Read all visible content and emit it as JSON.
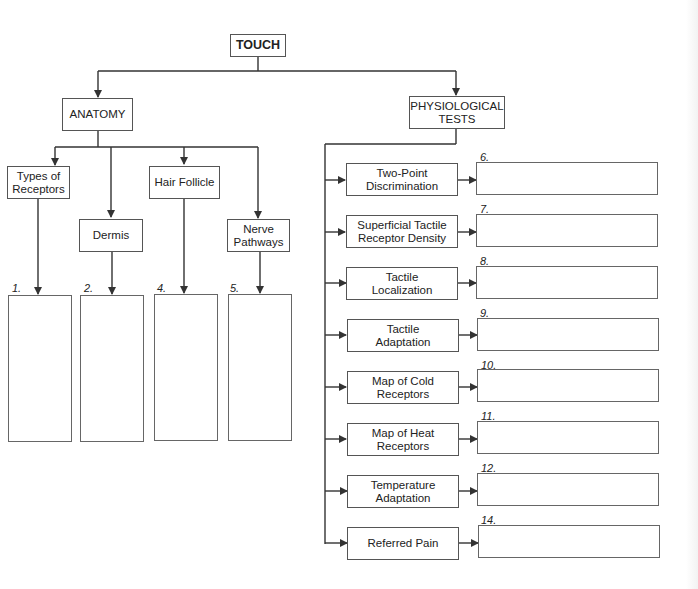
{
  "root": {
    "label": "TOUCH"
  },
  "anatomy": {
    "label": "ANATOMY",
    "children": [
      {
        "label": "Types of\nReceptors",
        "number": "1."
      },
      {
        "label": "Dermis",
        "number": "2."
      },
      {
        "label": "Hair Follicle",
        "number": "4."
      },
      {
        "label": "Nerve\nPathways",
        "number": "5."
      }
    ]
  },
  "physiological": {
    "label": "PHYSIOLOGICAL\nTESTS",
    "tests": [
      {
        "label": "Two-Point\nDiscrimination",
        "number": "6."
      },
      {
        "label": "Superficial Tactile\nReceptor Density",
        "number": "7."
      },
      {
        "label": "Tactile\nLocalization",
        "number": "8."
      },
      {
        "label": "Tactile\nAdaptation",
        "number": "9."
      },
      {
        "label": "Map of Cold\nReceptors",
        "number": "10."
      },
      {
        "label": "Map of Heat\nReceptors",
        "number": "11."
      },
      {
        "label": "Temperature\nAdaptation",
        "number": "12."
      },
      {
        "label": "Referred Pain",
        "number": "14."
      }
    ]
  },
  "colors": {
    "line": "#333333",
    "box_border": "#555555",
    "background": "#ffffff"
  }
}
